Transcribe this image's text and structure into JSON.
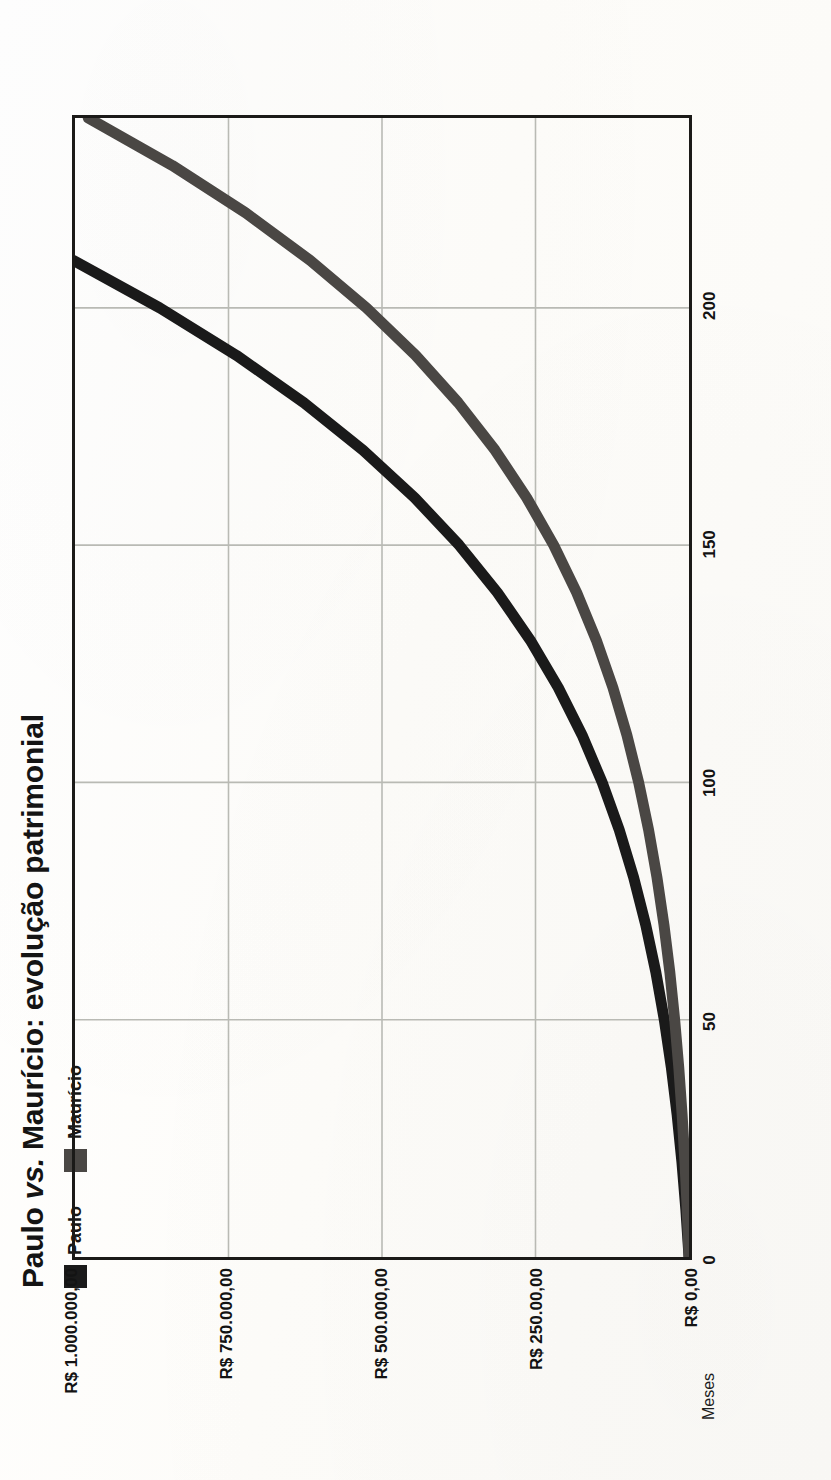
{
  "figure": {
    "title_main": "Paulo ",
    "title_italic": "vs.",
    "title_rest": " Maurício: evolução patrimonial",
    "title_full": "Paulo vs. Maurício: evolução patrimonial",
    "orientation": "rotated-90-ccw",
    "background_color": "#fdfdfb"
  },
  "legend": {
    "position": "top-left",
    "items": [
      {
        "label": "Paulo",
        "color": "#1a1a1a"
      },
      {
        "label": "Maurício",
        "color": "#4a4744"
      }
    ]
  },
  "axes": {
    "value_axis": {
      "title": "",
      "ticks": [
        {
          "label": "R$ 1.000.000,00",
          "value": 1000000
        },
        {
          "label": "R$ 750.000,00",
          "value": 750000
        },
        {
          "label": "R$ 500.000,00",
          "value": 500000
        },
        {
          "label": "R$ 250.00,00",
          "value": 250000
        },
        {
          "label": "R$ 0,00",
          "value": 0
        }
      ],
      "min": 0,
      "max": 1000000
    },
    "category_axis": {
      "title": "Meses",
      "ticks": [
        {
          "label": "0",
          "value": 0
        },
        {
          "label": "50",
          "value": 50
        },
        {
          "label": "100",
          "value": 100
        },
        {
          "label": "150",
          "value": 150
        },
        {
          "label": "200",
          "value": 200
        }
      ],
      "min": 0,
      "max": 240
    },
    "frame_color": "#1b1a18",
    "grid_color": "#b9bab4",
    "grid": true
  },
  "chart_data": {
    "type": "line",
    "title": "Paulo vs. Maurício: evolução patrimonial",
    "xlabel": "Meses",
    "ylabel": "",
    "xlim": [
      0,
      240
    ],
    "ylim": [
      0,
      1000000
    ],
    "grid": true,
    "legend_position": "top-left",
    "x": [
      0,
      10,
      20,
      30,
      40,
      50,
      60,
      70,
      80,
      90,
      100,
      110,
      120,
      130,
      140,
      150,
      160,
      170,
      180,
      190,
      200,
      210,
      220,
      230,
      240
    ],
    "series": [
      {
        "name": "Paulo",
        "color": "#1a1a1a",
        "values": [
          0,
          5200,
          11600,
          19400,
          28900,
          40300,
          54000,
          70500,
          90200,
          113600,
          141400,
          174200,
          213000,
          258600,
          312000,
          374400,
          446800,
          530800,
          627200,
          737200,
          862000,
          1003000,
          1161000,
          1338000,
          1536000
        ]
      },
      {
        "name": "Maurício",
        "color": "#4a4744",
        "values": [
          0,
          3000,
          6700,
          11200,
          16700,
          23300,
          31200,
          40800,
          52200,
          65800,
          82000,
          101200,
          124000,
          151000,
          182900,
          220400,
          264400,
          315800,
          375800,
          445300,
          525300,
          617000,
          721900,
          841700,
          978400
        ]
      }
    ]
  }
}
